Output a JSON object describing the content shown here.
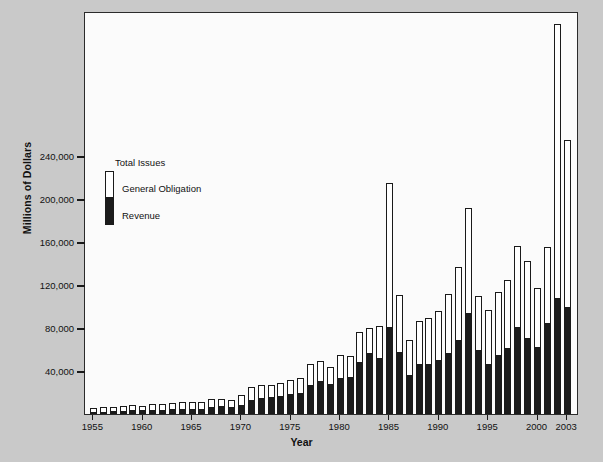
{
  "chart_data": {
    "type": "bar",
    "title": "",
    "xlabel": "Year",
    "ylabel": "Millions of Dollars",
    "ylim": [
      0,
      375000
    ],
    "yticks": [
      40000,
      80000,
      120000,
      160000,
      200000,
      240000
    ],
    "ytick_labels": [
      "40,000",
      "80,000",
      "120,000",
      "160,000",
      "200,000",
      "240,000"
    ],
    "grid": false,
    "legend_position": "upper-left-inside",
    "legend": {
      "title": "Total Issues",
      "entries": [
        {
          "label": "General Obligation",
          "color": "#ffffff"
        },
        {
          "label": "Revenue",
          "color": "#1b1b1b"
        }
      ]
    },
    "stacked": true,
    "xtick_labels": [
      "1955",
      "1960",
      "1965",
      "1970",
      "1975",
      "1980",
      "1985",
      "1990",
      "1995",
      "2000",
      "2003"
    ],
    "categories": [
      "1955",
      "1956",
      "1957",
      "1958",
      "1959",
      "1960",
      "1961",
      "1962",
      "1963",
      "1964",
      "1965",
      "1966",
      "1967",
      "1968",
      "1969",
      "1970",
      "1971",
      "1972",
      "1973",
      "1974",
      "1975",
      "1976",
      "1977",
      "1978",
      "1979",
      "1980",
      "1981",
      "1982",
      "1983",
      "1984",
      "1985",
      "1986",
      "1987",
      "1988",
      "1989",
      "1990",
      "1991",
      "1992",
      "1993",
      "1994",
      "1995",
      "1996",
      "1997",
      "1998",
      "1999",
      "2000",
      "2001",
      "2002",
      "2003"
    ],
    "series": [
      {
        "name": "Revenue",
        "values": [
          2000,
          2300,
          2600,
          3100,
          3300,
          3400,
          3900,
          4100,
          4600,
          5000,
          5000,
          4800,
          6300,
          7000,
          6500,
          8600,
          13500,
          15000,
          15400,
          16500,
          18500,
          19500,
          27000,
          31000,
          28000,
          33500,
          34000,
          48000,
          57000,
          52500,
          81000,
          58000,
          36000,
          47000,
          47000,
          50000,
          57000,
          69000,
          94000,
          60000,
          47000,
          55000,
          61000,
          81000,
          71000,
          62000,
          85000,
          108000,
          100000
        ]
      },
      {
        "name": "General Obligation",
        "values": [
          3500,
          3900,
          4200,
          4800,
          4900,
          4300,
          5300,
          5000,
          5600,
          6200,
          6200,
          6000,
          7900,
          7300,
          6200,
          9000,
          11500,
          11600,
          11800,
          12000,
          13500,
          14000,
          19500,
          18500,
          16000,
          21000,
          20000,
          28000,
          23000,
          29500,
          134000,
          53000,
          33000,
          40000,
          42500,
          46000,
          55000,
          67500,
          98000,
          50000,
          50000,
          58500,
          64000,
          75000,
          71000,
          55000,
          70000,
          255000,
          155000
        ]
      }
    ]
  }
}
